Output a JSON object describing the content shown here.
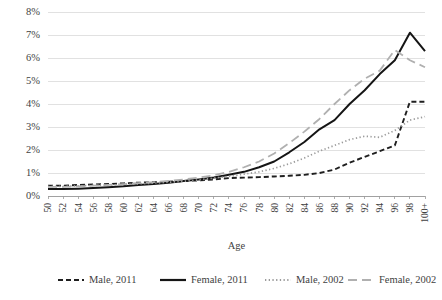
{
  "chart_data": {
    "type": "line",
    "title": "",
    "xlabel": "Age",
    "ylabel": "",
    "grid": true,
    "legend_position": "bottom",
    "ylim": [
      0,
      8
    ],
    "ytick_labels": [
      "0%",
      "1%",
      "2%",
      "3%",
      "4%",
      "5%",
      "6%",
      "7%",
      "8%"
    ],
    "ytick_values": [
      0,
      1,
      2,
      3,
      4,
      5,
      6,
      7,
      8
    ],
    "categories": [
      "50",
      "52",
      "54",
      "56",
      "58",
      "60",
      "62",
      "64",
      "66",
      "68",
      "70",
      "72",
      "74",
      "76",
      "78",
      "80",
      "82",
      "84",
      "86",
      "88",
      "90",
      "92",
      "94",
      "96",
      "98",
      "100+"
    ],
    "series": [
      {
        "name": "Male, 2011",
        "style": "dashed",
        "color": "#1f1f1f",
        "values": [
          0.45,
          0.45,
          0.48,
          0.5,
          0.52,
          0.55,
          0.58,
          0.6,
          0.62,
          0.65,
          0.68,
          0.72,
          0.78,
          0.8,
          0.82,
          0.85,
          0.88,
          0.92,
          1.0,
          1.15,
          1.45,
          1.7,
          1.95,
          2.2,
          4.1,
          4.1
        ]
      },
      {
        "name": "Female, 2011",
        "style": "solid",
        "color": "#151515",
        "values": [
          0.3,
          0.3,
          0.32,
          0.35,
          0.38,
          0.42,
          0.48,
          0.52,
          0.58,
          0.65,
          0.72,
          0.8,
          0.92,
          1.05,
          1.25,
          1.5,
          1.9,
          2.35,
          2.9,
          3.3,
          4.0,
          4.6,
          5.3,
          5.9,
          7.1,
          6.3
        ]
      },
      {
        "name": "Male, 2002",
        "style": "dotted",
        "color": "#9b9b9b",
        "values": [
          0.42,
          0.42,
          0.44,
          0.46,
          0.48,
          0.5,
          0.53,
          0.56,
          0.6,
          0.64,
          0.7,
          0.78,
          0.85,
          0.95,
          1.05,
          1.2,
          1.4,
          1.65,
          1.95,
          2.2,
          2.45,
          2.6,
          2.55,
          2.85,
          3.3,
          3.45
        ]
      },
      {
        "name": "Female, 2002",
        "style": "longdash",
        "color": "#b0b0b0",
        "values": [
          0.4,
          0.4,
          0.42,
          0.45,
          0.48,
          0.52,
          0.56,
          0.6,
          0.66,
          0.72,
          0.8,
          0.9,
          1.05,
          1.25,
          1.5,
          1.85,
          2.3,
          2.8,
          3.35,
          4.0,
          4.6,
          5.1,
          5.45,
          6.35,
          5.9,
          5.6
        ]
      }
    ]
  },
  "legend": {
    "items": [
      {
        "label": "Male, 2011"
      },
      {
        "label": "Female, 2011"
      },
      {
        "label": "Male, 2002"
      },
      {
        "label": "Female, 2002"
      }
    ]
  }
}
